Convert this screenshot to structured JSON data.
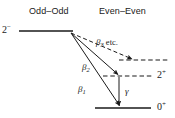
{
  "figure": {
    "type": "nuclear-decay-level-scheme",
    "width": 175,
    "height": 118,
    "background": "#ffffff",
    "line_color": "#1a1a1a",
    "text_color": "#1a1a1a"
  },
  "columns": {
    "left": {
      "header": "Odd–Odd"
    },
    "right": {
      "header": "Even–Even"
    }
  },
  "levels": [
    {
      "id": "parent",
      "spin_parity_base": "2",
      "spin_parity_sup": "−",
      "style": "solid",
      "column": "left",
      "label_side": "left",
      "x1": 19,
      "x2": 73,
      "y": 31
    },
    {
      "id": "excited-high",
      "spin_parity_base": "",
      "spin_parity_sup": "",
      "style": "dashed",
      "column": "right",
      "label_side": "right",
      "x1": 119,
      "x2": 170,
      "y": 60
    },
    {
      "id": "first-excited",
      "spin_parity_base": "2",
      "spin_parity_sup": "+",
      "style": "dashed",
      "column": "right",
      "label_side": "right",
      "x1": 103,
      "x2": 152,
      "y": 76
    },
    {
      "id": "ground",
      "spin_parity_base": "0",
      "spin_parity_sup": "+",
      "style": "solid",
      "column": "right",
      "label_side": "right",
      "x1": 95,
      "x2": 151,
      "y": 108
    }
  ],
  "transitions": [
    {
      "id": "beta3",
      "symbol": "β",
      "subscript": "3",
      "suffix": " etc.",
      "style": "dashed",
      "x1": 71,
      "y1": 33,
      "x2": 134,
      "y2": 60,
      "label_x": 96,
      "label_y": 38
    },
    {
      "id": "beta2",
      "symbol": "β",
      "subscript": "2",
      "suffix": "",
      "style": "solid",
      "x1": 71,
      "y1": 33,
      "x2": 119,
      "y2": 76,
      "label_x": 82,
      "label_y": 63
    },
    {
      "id": "beta1",
      "symbol": "β",
      "subscript": "1",
      "suffix": "",
      "style": "solid",
      "x1": 71,
      "y1": 33,
      "x2": 120,
      "y2": 107,
      "label_x": 78,
      "label_y": 85
    },
    {
      "id": "gamma",
      "symbol": "γ",
      "subscript": "",
      "suffix": "",
      "style": "solid",
      "x1": 119,
      "y1": 77,
      "x2": 119,
      "y2": 107,
      "label_x": 125,
      "label_y": 87
    }
  ]
}
